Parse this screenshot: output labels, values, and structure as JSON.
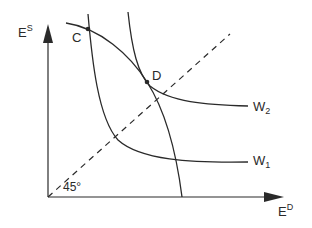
{
  "diagram": {
    "axes": {
      "y_label": "E",
      "y_label_sup": "S",
      "x_label": "E",
      "x_label_sup": "D"
    },
    "points": {
      "c": "C",
      "d": "D"
    },
    "curves": {
      "w2_label": "W",
      "w2_sub": "2",
      "w1_label": "W",
      "w1_sub": "1"
    },
    "reference_line": {
      "angle_label": "45°",
      "style": "dashed"
    },
    "colors": {
      "ink": "#2a2a2a",
      "background": "#ffffff"
    }
  }
}
